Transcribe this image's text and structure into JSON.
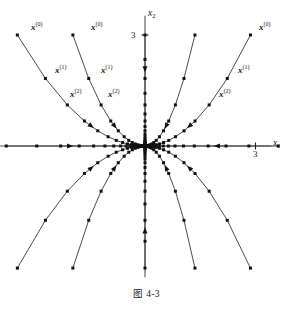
{
  "figure": {
    "caption": "图 4-3",
    "type": "phase-portrait"
  },
  "axes": {
    "x_label": "x",
    "x_subscript": "1",
    "y_label": "x",
    "y_subscript": "2",
    "x_tick_label": "3",
    "y_tick_label": "3",
    "color": "#555555"
  },
  "labels": {
    "x0": "x",
    "x0_sup": "(0)",
    "x1": "x",
    "x1_sup": "(1)",
    "x2": "x",
    "x2_sup": "(2)"
  },
  "style": {
    "background": "#ffffff",
    "ink": "#1a1a1a",
    "curve": "#2b2b2b",
    "point": "#111111"
  },
  "chart_data": {
    "type": "scatter",
    "title": "图 4-3",
    "xlabel": "x1",
    "ylabel": "x2",
    "xlim": [
      -3.9,
      3.9
    ],
    "ylim": [
      -3.55,
      3.55
    ],
    "grid": false,
    "legend": "none",
    "xticks": [
      3
    ],
    "yticks": [
      3
    ],
    "iteration_ratio": 0.78,
    "origin_px": [
      145,
      146
    ],
    "unit_px": 37,
    "series": [
      {
        "name": "traj-q2-outer",
        "start": [
          -3.45,
          3.0
        ],
        "exponent": 2.0,
        "label_points": [
          "x(0)",
          "x(1)",
          "x(2)"
        ],
        "arrow_at_step": 3
      },
      {
        "name": "traj-q2-inner",
        "start": [
          -1.95,
          3.0
        ],
        "exponent": 2.0,
        "label_points": [
          "x(0)",
          "x(1)",
          "x(2)"
        ],
        "arrow_at_step": 3
      },
      {
        "name": "traj-q1-inner",
        "start": [
          1.35,
          3.0
        ],
        "exponent": 2.0,
        "label_points": [],
        "arrow_at_step": 3
      },
      {
        "name": "traj-q1-outer",
        "start": [
          2.85,
          3.0
        ],
        "exponent": 2.0,
        "label_points": [
          "x(0)",
          "x(1)",
          "x(2)"
        ],
        "arrow_at_step": 3
      },
      {
        "name": "traj-q3-outer",
        "start": [
          -3.45,
          -3.3
        ],
        "exponent": 2.0,
        "label_points": [],
        "arrow_at_step": 3
      },
      {
        "name": "traj-q3-inner",
        "start": [
          -1.95,
          -3.3
        ],
        "exponent": 2.0,
        "label_points": [],
        "arrow_at_step": 3
      },
      {
        "name": "traj-q4-inner",
        "start": [
          1.35,
          -3.3
        ],
        "exponent": 2.0,
        "label_points": [],
        "arrow_at_step": 3
      },
      {
        "name": "traj-q4-outer",
        "start": [
          2.85,
          -3.3
        ],
        "exponent": 2.0,
        "label_points": [],
        "arrow_at_step": 3
      },
      {
        "name": "axis-traj-pos-x",
        "start": [
          3.6,
          0
        ],
        "exponent": 0,
        "label_points": [],
        "arrow_at_step": 2
      },
      {
        "name": "axis-traj-neg-x",
        "start": [
          -3.75,
          0
        ],
        "exponent": 0,
        "label_points": [],
        "arrow_at_step": 2
      },
      {
        "name": "axis-traj-pos-y",
        "start": [
          0,
          3.0
        ],
        "exponent": 0,
        "label_points": [],
        "arrow_at_step": 1
      },
      {
        "name": "axis-traj-neg-y",
        "start": [
          0,
          -3.3
        ],
        "exponent": 0,
        "label_points": [],
        "arrow_at_step": 1
      }
    ],
    "point_labels": [
      {
        "text": "x(0)",
        "at_series": "traj-q2-outer",
        "iterate": 0
      },
      {
        "text": "x(1)",
        "at_series": "traj-q2-outer",
        "iterate": 1
      },
      {
        "text": "x(2)",
        "at_series": "traj-q2-outer",
        "iterate": 2
      },
      {
        "text": "x(0)",
        "at_series": "traj-q2-inner",
        "iterate": 0
      },
      {
        "text": "x(1)",
        "at_series": "traj-q2-inner",
        "iterate": 1
      },
      {
        "text": "x(2)",
        "at_series": "traj-q2-inner",
        "iterate": 2
      },
      {
        "text": "x(0)",
        "at_series": "traj-q1-outer",
        "iterate": 0
      },
      {
        "text": "x(1)",
        "at_series": "traj-q1-outer",
        "iterate": 1
      },
      {
        "text": "x(2)",
        "at_series": "traj-q1-outer",
        "iterate": 2
      }
    ]
  }
}
